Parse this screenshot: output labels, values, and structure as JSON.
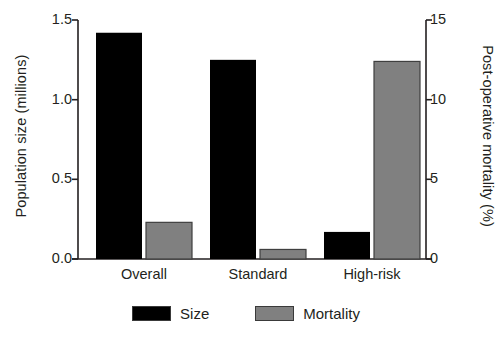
{
  "chart_data": {
    "type": "bar",
    "title": "",
    "subtitle": "",
    "categories": [
      "Overall",
      "Standard",
      "High-risk"
    ],
    "series": [
      {
        "name": "Size",
        "axis": "left",
        "color": "#000000",
        "values": [
          1.42,
          1.25,
          0.17
        ]
      },
      {
        "name": "Mortality",
        "axis": "right",
        "color": "#808080",
        "values": [
          2.3,
          0.6,
          12.4
        ]
      }
    ],
    "xlabel": "",
    "ylabel": "Population size (millions)",
    "y2label": "Post-operative mortality (%)",
    "ylim": [
      0.0,
      1.5
    ],
    "y2lim": [
      0,
      15
    ],
    "yticks": [
      0.0,
      0.5,
      1.0,
      1.5
    ],
    "ytick_labels": [
      "0.0",
      "0.5",
      "1.0",
      "1.5"
    ],
    "y2ticks": [
      0,
      5,
      10,
      15
    ],
    "y2tick_labels": [
      "0",
      "5",
      "10",
      "15"
    ],
    "grid": false,
    "legend_position": "bottom",
    "legend_entries": [
      "Size",
      "Mortality"
    ]
  },
  "axes": {
    "left_title": "Population size (millions)",
    "right_title": "Post-operative mortality (%)"
  },
  "ticks": {
    "left": [
      "1.5",
      "1.0",
      "0.5",
      "0.0"
    ],
    "right": [
      "15",
      "10",
      "5",
      "0"
    ]
  },
  "categories": [
    "Overall",
    "Standard",
    "High-risk"
  ],
  "legend": {
    "items": [
      {
        "label": "Size",
        "color": "#000000"
      },
      {
        "label": "Mortality",
        "color": "#808080"
      }
    ]
  },
  "colors": {
    "size_bar": "#000000",
    "mortality_bar": "#808080",
    "mortality_bar_border": "#3f3f3f",
    "axis": "#231f20",
    "text": "#231f20",
    "background": "#ffffff"
  }
}
